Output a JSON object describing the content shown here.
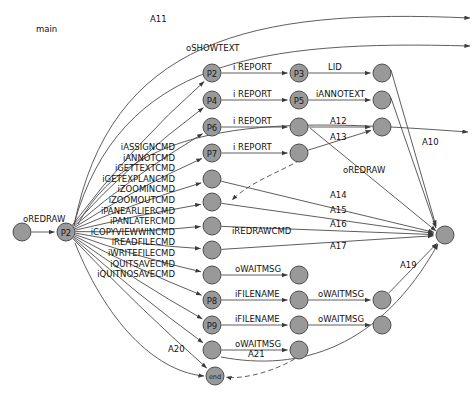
{
  "diagram": {
    "title": "main",
    "nodes": [
      {
        "id": "start",
        "label": "",
        "cx": 22,
        "cy": 232,
        "r": 9
      },
      {
        "id": "hub",
        "label": "P2",
        "cx": 66,
        "cy": 232,
        "r": 9
      },
      {
        "id": "n_p2",
        "label": "P2",
        "cx": 212,
        "cy": 73,
        "r": 9
      },
      {
        "id": "n_p4",
        "label": "P4",
        "cx": 212,
        "cy": 100,
        "r": 9
      },
      {
        "id": "n_p6",
        "label": "P6",
        "cx": 212,
        "cy": 127,
        "r": 9
      },
      {
        "id": "n_p7",
        "label": "P7",
        "cx": 212,
        "cy": 153,
        "r": 9
      },
      {
        "id": "n_c1",
        "label": "",
        "cx": 212,
        "cy": 179,
        "r": 9
      },
      {
        "id": "n_c2",
        "label": "",
        "cx": 212,
        "cy": 202,
        "r": 9
      },
      {
        "id": "n_c3",
        "label": "",
        "cx": 212,
        "cy": 226,
        "r": 9
      },
      {
        "id": "n_c4",
        "label": "",
        "cx": 212,
        "cy": 250,
        "r": 9
      },
      {
        "id": "n_c5",
        "label": "",
        "cx": 212,
        "cy": 275,
        "r": 9
      },
      {
        "id": "n_p8",
        "label": "P8",
        "cx": 212,
        "cy": 300,
        "r": 9
      },
      {
        "id": "n_p9",
        "label": "P9",
        "cx": 212,
        "cy": 325,
        "r": 9
      },
      {
        "id": "n_c6",
        "label": "",
        "cx": 212,
        "cy": 350,
        "r": 9
      },
      {
        "id": "n_end",
        "label": "end",
        "cx": 215,
        "cy": 376,
        "r": 9
      },
      {
        "id": "n_p3",
        "label": "P3",
        "cx": 299,
        "cy": 73,
        "r": 9
      },
      {
        "id": "n_p5",
        "label": "P5",
        "cx": 299,
        "cy": 100,
        "r": 9
      },
      {
        "id": "n_m3",
        "label": "",
        "cx": 299,
        "cy": 127,
        "r": 9
      },
      {
        "id": "n_m4",
        "label": "",
        "cx": 299,
        "cy": 153,
        "r": 9
      },
      {
        "id": "n_m5",
        "label": "",
        "cx": 299,
        "cy": 275,
        "r": 9
      },
      {
        "id": "n_m6",
        "label": "",
        "cx": 299,
        "cy": 300,
        "r": 9
      },
      {
        "id": "n_m7",
        "label": "",
        "cx": 299,
        "cy": 325,
        "r": 9
      },
      {
        "id": "n_m8",
        "label": "",
        "cx": 299,
        "cy": 350,
        "r": 9
      },
      {
        "id": "n_r1",
        "label": "",
        "cx": 382,
        "cy": 73,
        "r": 9
      },
      {
        "id": "n_r2",
        "label": "",
        "cx": 382,
        "cy": 100,
        "r": 9
      },
      {
        "id": "n_r3",
        "label": "",
        "cx": 382,
        "cy": 127,
        "r": 9
      },
      {
        "id": "n_r4",
        "label": "",
        "cx": 382,
        "cy": 300,
        "r": 9
      },
      {
        "id": "n_r5",
        "label": "",
        "cx": 382,
        "cy": 325,
        "r": 9
      },
      {
        "id": "n_sink",
        "label": "",
        "cx": 445,
        "cy": 235,
        "r": 9
      }
    ],
    "hub_out_labels": [
      "iASSIGNCMD",
      "iANNOTCMD",
      "iGETTEXTCMD",
      "iGETEXPLANCMD",
      "iZOOMINCMD",
      "iZOOMOUTCMD",
      "iPANEARLIERCMD",
      "iPANLATERCMD",
      "iCOPYVIEWWINCMD",
      "iREADFILECMD",
      "iWRITEFILECMD",
      "iQUITSAVECMD",
      "iQUITNOSAVECMD"
    ],
    "edge_labels": [
      {
        "name": "edge-label-a11",
        "text": "A11",
        "x": 150,
        "y": 22
      },
      {
        "name": "edge-label-oshowtext",
        "text": "oSHOWTEXT",
        "x": 186,
        "y": 51
      },
      {
        "name": "edge-label-oredraw-in",
        "text": "oREDRAW",
        "x": 23,
        "y": 222
      },
      {
        "name": "edge-label-ireport-1",
        "text": "i REPORT",
        "x": 233,
        "y": 70
      },
      {
        "name": "edge-label-ireport-2",
        "text": "i REPORT",
        "x": 233,
        "y": 97
      },
      {
        "name": "edge-label-ireport-3",
        "text": "i REPORT",
        "x": 233,
        "y": 124
      },
      {
        "name": "edge-label-ireport-4",
        "text": "i REPORT",
        "x": 233,
        "y": 150
      },
      {
        "name": "edge-label-lid",
        "text": "LID",
        "x": 328,
        "y": 70
      },
      {
        "name": "edge-label-iannotext",
        "text": "iANNOTEXT",
        "x": 316,
        "y": 97
      },
      {
        "name": "edge-label-a12",
        "text": "A12",
        "x": 330,
        "y": 124
      },
      {
        "name": "edge-label-a13",
        "text": "A13",
        "x": 330,
        "y": 140
      },
      {
        "name": "edge-label-a10",
        "text": "A10",
        "x": 422,
        "y": 145
      },
      {
        "name": "edge-label-oredraw-out",
        "text": "oREDRAW",
        "x": 343,
        "y": 173
      },
      {
        "name": "edge-label-a14",
        "text": "A14",
        "x": 330,
        "y": 198
      },
      {
        "name": "edge-label-a15",
        "text": "A15",
        "x": 330,
        "y": 213
      },
      {
        "name": "edge-label-a16",
        "text": "A16",
        "x": 330,
        "y": 227
      },
      {
        "name": "edge-label-iredrawcmd",
        "text": "iREDRAWCMD",
        "x": 232,
        "y": 234
      },
      {
        "name": "edge-label-a17",
        "text": "A17",
        "x": 330,
        "y": 249
      },
      {
        "name": "edge-label-owaitmsg-1",
        "text": "oWAITMSG",
        "x": 235,
        "y": 272
      },
      {
        "name": "edge-label-ifilename-1",
        "text": "iFILENAME",
        "x": 235,
        "y": 297
      },
      {
        "name": "edge-label-owaitmsg-2",
        "text": "oWAITMSG",
        "x": 318,
        "y": 297
      },
      {
        "name": "edge-label-ifilename-2",
        "text": "iFILENAME",
        "x": 235,
        "y": 322
      },
      {
        "name": "edge-label-owaitmsg-3",
        "text": "oWAITMSG",
        "x": 318,
        "y": 322
      },
      {
        "name": "edge-label-owaitmsg-4",
        "text": "oWAITMSG",
        "x": 235,
        "y": 347
      },
      {
        "name": "edge-label-a19",
        "text": "A19",
        "x": 400,
        "y": 268
      },
      {
        "name": "edge-label-a20",
        "text": "A20",
        "x": 168,
        "y": 352
      },
      {
        "name": "edge-label-a21",
        "text": "A21",
        "x": 248,
        "y": 357
      }
    ],
    "colors": {
      "node_fill": "#999999",
      "node_stroke": "#4d4d4d",
      "edge_stroke": "#4c4c4c",
      "text": "#111111",
      "background": "#ffffff"
    }
  }
}
